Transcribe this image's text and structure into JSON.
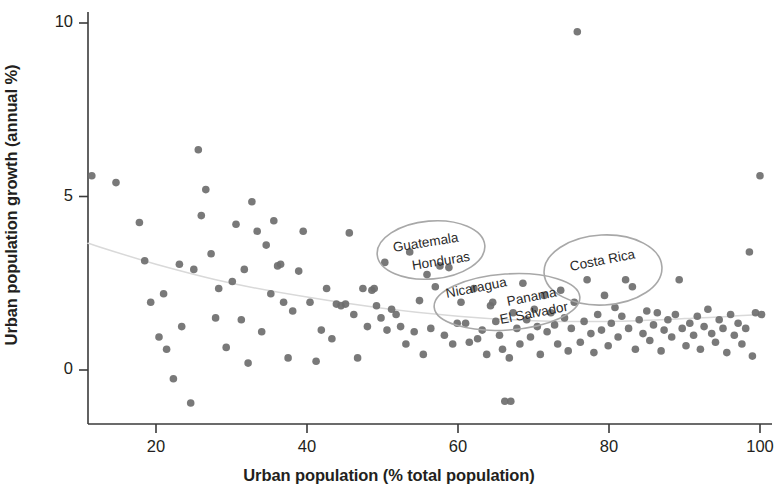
{
  "chart_data": {
    "type": "scatter",
    "title": "",
    "xlabel": "Urban population (% total population)",
    "ylabel": "Urban population growth (annual %)",
    "xlim": [
      10,
      102
    ],
    "ylim": [
      -1.6,
      10.4
    ],
    "xticks": [
      20,
      40,
      60,
      80,
      100
    ],
    "xtick_labels": [
      "20",
      "40",
      "60",
      "80",
      "100"
    ],
    "yticks": [
      0,
      5,
      10
    ],
    "ytick_labels": [
      "0",
      "5",
      "10"
    ],
    "grid": false,
    "legend": "none",
    "point_color": "#6e6e6e",
    "trend_color": "#d9d9d9",
    "annotation_color": "#a8a8a8",
    "series": [
      {
        "name": "Countries",
        "points": [
          [
            11.5,
            5.6
          ],
          [
            14.7,
            5.4
          ],
          [
            17.8,
            4.25
          ],
          [
            18.5,
            3.15
          ],
          [
            19.3,
            1.95
          ],
          [
            20.4,
            0.95
          ],
          [
            21.0,
            2.2
          ],
          [
            21.4,
            0.6
          ],
          [
            22.3,
            -0.25
          ],
          [
            23.1,
            3.05
          ],
          [
            23.4,
            1.25
          ],
          [
            24.6,
            -0.95
          ],
          [
            25.0,
            2.9
          ],
          [
            25.6,
            6.35
          ],
          [
            26.0,
            4.45
          ],
          [
            26.6,
            5.2
          ],
          [
            27.3,
            3.35
          ],
          [
            27.9,
            1.5
          ],
          [
            28.3,
            2.35
          ],
          [
            29.3,
            0.65
          ],
          [
            30.1,
            2.55
          ],
          [
            30.6,
            4.2
          ],
          [
            31.3,
            1.45
          ],
          [
            31.7,
            2.9
          ],
          [
            32.2,
            0.2
          ],
          [
            32.7,
            4.85
          ],
          [
            33.4,
            4.0
          ],
          [
            34.0,
            1.1
          ],
          [
            34.6,
            3.6
          ],
          [
            35.2,
            2.2
          ],
          [
            35.6,
            4.3
          ],
          [
            36.1,
            3.0
          ],
          [
            36.5,
            3.05
          ],
          [
            36.9,
            1.95
          ],
          [
            37.5,
            0.35
          ],
          [
            38.1,
            1.7
          ],
          [
            38.9,
            2.85
          ],
          [
            39.5,
            4.0
          ],
          [
            40.4,
            1.95
          ],
          [
            41.2,
            0.25
          ],
          [
            41.9,
            1.15
          ],
          [
            42.6,
            2.35
          ],
          [
            43.3,
            0.9
          ],
          [
            43.9,
            1.9
          ],
          [
            44.5,
            1.85
          ],
          [
            45.1,
            1.9
          ],
          [
            45.6,
            3.95
          ],
          [
            46.2,
            1.6
          ],
          [
            46.7,
            0.35
          ],
          [
            47.4,
            2.35
          ],
          [
            48.0,
            1.25
          ],
          [
            48.6,
            2.3
          ],
          [
            48.9,
            2.35
          ],
          [
            49.2,
            1.85
          ],
          [
            49.8,
            1.5
          ],
          [
            50.3,
            3.1
          ],
          [
            50.6,
            1.15
          ],
          [
            51.2,
            1.75
          ],
          [
            51.8,
            1.6
          ],
          [
            52.4,
            1.25
          ],
          [
            53.1,
            0.75
          ],
          [
            53.6,
            3.4
          ],
          [
            54.2,
            1.1
          ],
          [
            54.9,
            2.0
          ],
          [
            55.4,
            0.45
          ],
          [
            55.9,
            2.75
          ],
          [
            56.4,
            1.2
          ],
          [
            57.0,
            2.4
          ],
          [
            57.6,
            3.0
          ],
          [
            58.2,
            1.0
          ],
          [
            58.8,
            2.95
          ],
          [
            59.3,
            0.75
          ],
          [
            59.9,
            1.35
          ],
          [
            60.4,
            1.95
          ],
          [
            61.0,
            1.35
          ],
          [
            61.5,
            0.8
          ],
          [
            62.1,
            2.35
          ],
          [
            62.6,
            0.9
          ],
          [
            63.2,
            1.15
          ],
          [
            63.8,
            0.45
          ],
          [
            64.3,
            1.85
          ],
          [
            64.6,
            1.95
          ],
          [
            65.0,
            1.4
          ],
          [
            65.5,
            1.0
          ],
          [
            65.9,
            0.6
          ],
          [
            66.2,
            -0.9
          ],
          [
            67.0,
            -0.9
          ],
          [
            66.8,
            0.35
          ],
          [
            67.3,
            1.65
          ],
          [
            67.8,
            1.2
          ],
          [
            68.2,
            0.75
          ],
          [
            68.6,
            2.5
          ],
          [
            69.1,
            1.45
          ],
          [
            69.6,
            0.95
          ],
          [
            70.1,
            1.75
          ],
          [
            70.5,
            1.25
          ],
          [
            70.9,
            0.45
          ],
          [
            71.4,
            2.15
          ],
          [
            71.8,
            1.1
          ],
          [
            72.3,
            1.65
          ],
          [
            72.8,
            1.3
          ],
          [
            73.2,
            0.75
          ],
          [
            73.6,
            2.3
          ],
          [
            74.1,
            1.5
          ],
          [
            74.6,
            0.55
          ],
          [
            75.0,
            1.2
          ],
          [
            75.4,
            1.95
          ],
          [
            75.8,
            9.75
          ],
          [
            76.2,
            0.8
          ],
          [
            76.7,
            1.4
          ],
          [
            77.1,
            2.6
          ],
          [
            77.6,
            1.05
          ],
          [
            78.0,
            0.5
          ],
          [
            78.5,
            1.6
          ],
          [
            79.0,
            1.15
          ],
          [
            79.4,
            2.15
          ],
          [
            79.9,
            0.7
          ],
          [
            80.3,
            1.35
          ],
          [
            80.8,
            1.8
          ],
          [
            81.2,
            0.95
          ],
          [
            81.7,
            1.55
          ],
          [
            82.2,
            2.6
          ],
          [
            82.6,
            1.2
          ],
          [
            83.1,
            2.4
          ],
          [
            83.5,
            0.6
          ],
          [
            84.0,
            1.45
          ],
          [
            84.5,
            1.05
          ],
          [
            85.0,
            1.7
          ],
          [
            85.4,
            0.85
          ],
          [
            85.9,
            1.3
          ],
          [
            86.4,
            1.65
          ],
          [
            86.9,
            0.55
          ],
          [
            87.3,
            1.15
          ],
          [
            87.8,
            1.45
          ],
          [
            88.3,
            0.95
          ],
          [
            88.8,
            1.6
          ],
          [
            89.3,
            2.6
          ],
          [
            89.7,
            1.2
          ],
          [
            90.2,
            0.7
          ],
          [
            90.7,
            1.35
          ],
          [
            91.2,
            1.0
          ],
          [
            91.7,
            1.55
          ],
          [
            92.1,
            0.6
          ],
          [
            92.6,
            1.25
          ],
          [
            93.1,
            1.75
          ],
          [
            93.6,
            1.05
          ],
          [
            94.1,
            0.8
          ],
          [
            94.6,
            1.45
          ],
          [
            95.1,
            1.2
          ],
          [
            95.6,
            0.5
          ],
          [
            96.1,
            1.6
          ],
          [
            96.6,
            1.0
          ],
          [
            97.1,
            1.35
          ],
          [
            97.6,
            0.75
          ],
          [
            98.1,
            1.2
          ],
          [
            98.6,
            3.4
          ],
          [
            99.0,
            0.4
          ],
          [
            99.4,
            1.65
          ],
          [
            100.0,
            5.6
          ],
          [
            100.2,
            1.6
          ]
        ]
      }
    ],
    "trend_line": {
      "name": "LOWESS fit",
      "points": [
        [
          11.0,
          3.65
        ],
        [
          20.0,
          3.05
        ],
        [
          30.0,
          2.5
        ],
        [
          40.0,
          2.1
        ],
        [
          50.0,
          1.78
        ],
        [
          60.0,
          1.55
        ],
        [
          70.0,
          1.42
        ],
        [
          80.0,
          1.4
        ],
        [
          90.0,
          1.48
        ],
        [
          100.0,
          1.6
        ]
      ]
    },
    "annotations": [
      {
        "id": "guatemala-honduras",
        "labels": [
          "Guatemala",
          "Honduras"
        ],
        "ellipse": {
          "cx": 431,
          "cy": 250,
          "rx": 54,
          "ry": 29,
          "rotate": -5
        },
        "label_positions": [
          {
            "text": "Guatemala",
            "x": 393,
            "y": 249,
            "rotate": -9
          },
          {
            "text": "Honduras",
            "x": 412,
            "y": 267,
            "rotate": -9
          }
        ]
      },
      {
        "id": "nicaragua-panama-elsalvador",
        "labels": [
          "Nicaragua",
          "Panama",
          "El Salvador"
        ],
        "ellipse": {
          "cx": 507,
          "cy": 302,
          "rx": 73,
          "ry": 28,
          "rotate": -4
        },
        "label_positions": [
          {
            "text": "Nicaragua",
            "x": 446,
            "y": 295,
            "rotate": -11
          },
          {
            "text": "Panama",
            "x": 507,
            "y": 303,
            "rotate": -11
          },
          {
            "text": "El Salvador",
            "x": 500,
            "y": 321,
            "rotate": -11
          }
        ]
      },
      {
        "id": "costa-rica",
        "labels": [
          "Costa Rica"
        ],
        "ellipse": {
          "cx": 603,
          "cy": 270,
          "rx": 59,
          "ry": 35,
          "rotate": -3
        },
        "label_positions": [
          {
            "text": "Costa Rica",
            "x": 570,
            "y": 268,
            "rotate": -11
          }
        ]
      }
    ]
  }
}
